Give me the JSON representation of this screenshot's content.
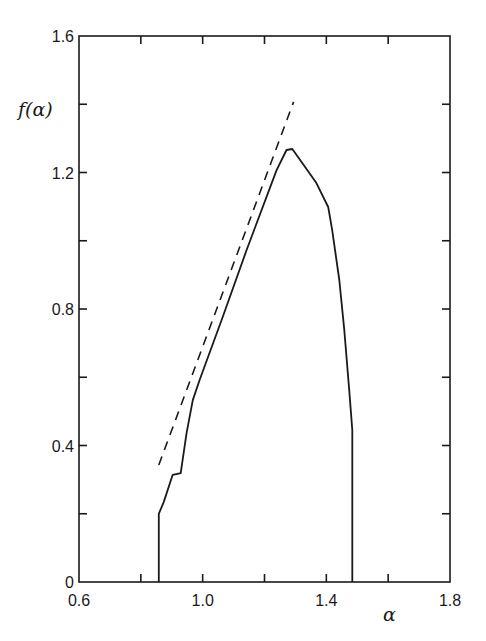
{
  "chart_data": {
    "type": "line",
    "title": "",
    "xlabel": "α",
    "ylabel": "f(α)",
    "xlim": [
      0.6,
      1.8
    ],
    "ylim": [
      0,
      1.6
    ],
    "x_ticks_labeled": [
      0.6,
      1.0,
      1.4,
      1.8
    ],
    "x_tick_labels": [
      "0.6",
      "1.0",
      "1.4",
      "1.8"
    ],
    "x_ticks_minor_step": 0.2,
    "y_ticks_labeled": [
      0,
      0.4,
      0.8,
      1.2,
      1.6
    ],
    "y_tick_labels": [
      "0",
      "0.4",
      "0.8",
      "1.2",
      "1.6"
    ],
    "y_ticks_minor_step": 0.2,
    "grid": false,
    "legend": null,
    "series": [
      {
        "name": "f(alpha) spectrum",
        "style": "solid",
        "x": [
          0.858,
          0.858,
          0.874,
          0.903,
          0.929,
          0.948,
          0.968,
          0.99,
          1.065,
          1.142,
          1.239,
          1.271,
          1.29,
          1.329,
          1.368,
          1.406,
          1.419,
          1.442,
          1.458,
          1.474,
          1.484,
          1.484
        ],
        "y": [
          0.0,
          0.2,
          0.234,
          0.314,
          0.319,
          0.437,
          0.533,
          0.592,
          0.777,
          0.973,
          1.207,
          1.266,
          1.269,
          1.219,
          1.169,
          1.099,
          1.031,
          0.885,
          0.738,
          0.563,
          0.445,
          0.0
        ]
      },
      {
        "name": "reference line",
        "style": "dashed",
        "x": [
          0.858,
          1.294
        ],
        "y": [
          0.343,
          1.407
        ]
      }
    ]
  }
}
